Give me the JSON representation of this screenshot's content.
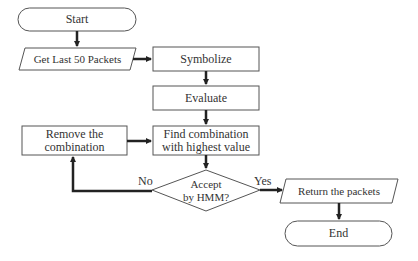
{
  "diagram": {
    "type": "flowchart",
    "nodes": {
      "start": {
        "label": "Start",
        "shape": "terminator"
      },
      "get_packets": {
        "label": "Get Last 50 Packets",
        "shape": "parallelogram"
      },
      "symbolize": {
        "label": "Symbolize",
        "shape": "process"
      },
      "evaluate": {
        "label": "Evaluate",
        "shape": "process"
      },
      "find": {
        "label": "Find combination with highest value",
        "line1": "Find combination",
        "line2": "with highest value",
        "shape": "process"
      },
      "remove": {
        "label": "Remove the combination",
        "line1": "Remove the",
        "line2": "combination",
        "shape": "process"
      },
      "accept": {
        "label": "Accept by HMM?",
        "line1": "Accept",
        "line2": "by HMM?",
        "shape": "decision"
      },
      "return": {
        "label": "Return the packets",
        "shape": "parallelogram"
      },
      "end": {
        "label": "End",
        "shape": "terminator"
      }
    },
    "edges": [
      {
        "from": "start",
        "to": "get_packets",
        "label": ""
      },
      {
        "from": "get_packets",
        "to": "symbolize",
        "label": ""
      },
      {
        "from": "symbolize",
        "to": "evaluate",
        "label": ""
      },
      {
        "from": "evaluate",
        "to": "find",
        "label": ""
      },
      {
        "from": "find",
        "to": "accept",
        "label": ""
      },
      {
        "from": "accept",
        "to": "return",
        "label": "Yes"
      },
      {
        "from": "accept",
        "to": "remove",
        "label": "No"
      },
      {
        "from": "remove",
        "to": "find",
        "label": ""
      },
      {
        "from": "return",
        "to": "end",
        "label": ""
      }
    ],
    "edge_labels": {
      "yes": "Yes",
      "no": "No"
    },
    "colors": {
      "stroke": "#333333",
      "fill": "#ffffff",
      "text": "#333333"
    }
  }
}
